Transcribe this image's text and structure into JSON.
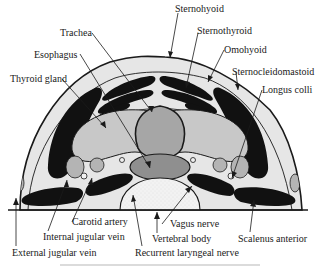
{
  "diagram": {
    "colors": {
      "outline": "#1a1a1a",
      "background_tissue": "#e6e6e6",
      "muscle": "#111111",
      "thyroid": "#c8c8c8",
      "trachea": "#a6a6a6",
      "esophagus": "#8f8f8f",
      "vessel": "#b4b4b4",
      "vertebral_body": "#f2f2f2"
    },
    "labels": {
      "trachea": "Trachea",
      "esophagus": "Esophagus",
      "thyroid_gland": "Thyroid gland",
      "sternohyoid": "Sternohyoid",
      "sternothyroid": "Sternothyroid",
      "omohyoid": "Omohyoid",
      "sternocleidomastoid": "Sternocleidomastoid",
      "longus_colli": "Longus colli",
      "carotid_artery": "Carotid artery",
      "internal_jugular_vein": "Internal jugular vein",
      "external_jugular_vein": "External jugular vein",
      "vagus_nerve": "Vagus nerve",
      "vertebral_body": "Vertebral body",
      "recurrent_laryngeal_nerve": "Recurrent laryngeal nerve",
      "scalenus_anterior": "Scalenus anterior"
    }
  }
}
